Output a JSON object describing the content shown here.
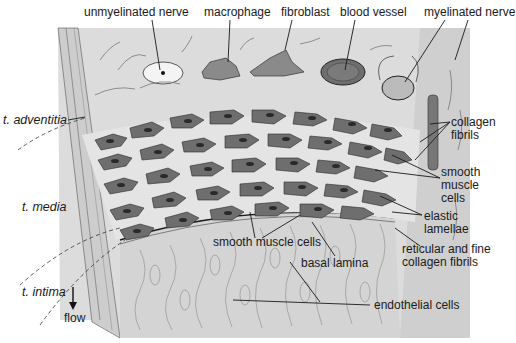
{
  "diagram": {
    "colors": {
      "background": "#ffffff",
      "tissue_light": "#dcdcdc",
      "tissue_mid": "#c8c8c8",
      "cell_fill": "#6e6e6e",
      "nucleus": "#2a2a2a",
      "lamina": "#f1f1f1",
      "line": "#1a1a1a"
    },
    "top_labels": [
      {
        "text": "unmyelinated nerve"
      },
      {
        "text": "macrophage"
      },
      {
        "text": "fibroblast"
      },
      {
        "text": "blood vessel"
      },
      {
        "text": "myelinated nerve"
      }
    ],
    "left_labels": {
      "adventitia": "t. adventitia",
      "media": "t. media",
      "intima": "t. intima",
      "flow": "flow"
    },
    "right_labels": {
      "collagen_fibrils": "collagen\nfibrils",
      "smooth_muscle_cells": "smooth\nmuscle\ncells",
      "elastic_lamellae": "elastic\nlamellae",
      "reticular": "reticular and fine\ncollagen fibrils"
    },
    "bottom_labels": {
      "smooth_muscle_cells": "smooth muscle cells",
      "basal_lamina": "basal lamina",
      "endothelial_cells": "endothelial cells"
    }
  }
}
